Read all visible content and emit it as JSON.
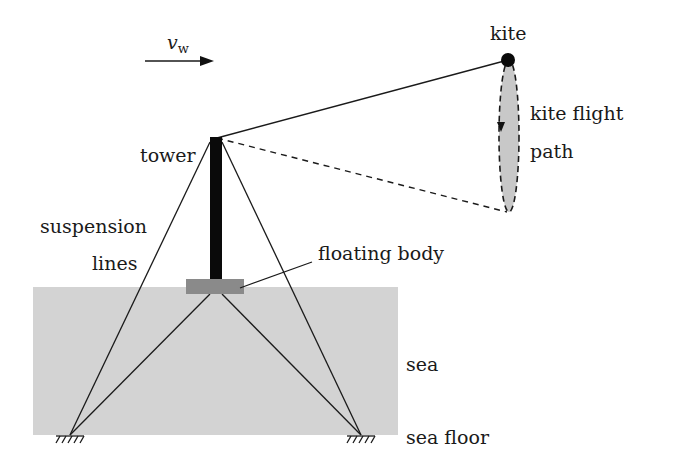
{
  "diagram": {
    "labels": {
      "wind_velocity_symbol": "v",
      "wind_velocity_subscript": "w",
      "kite": "kite",
      "kite_flight_path_line1": "kite flight",
      "kite_flight_path_line2": "path",
      "tower": "tower",
      "suspension_lines_line1": "suspension",
      "suspension_lines_line2": "lines",
      "floating_body": "floating body",
      "sea": "sea",
      "sea_floor": "sea floor"
    },
    "colors": {
      "sea": "#d3d3d3",
      "floating_body": "#8a8a8a",
      "tower": "#0a0a0a",
      "lines": "#1a1a1a",
      "flight_path_fill": "#c8c8c8"
    }
  }
}
